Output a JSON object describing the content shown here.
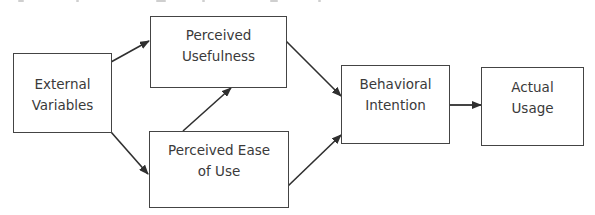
{
  "diagram": {
    "type": "flowchart",
    "colors": {
      "box_border": "#444444",
      "text": "#3a3a3a",
      "arrow": "#2f2f2f",
      "background": "#ffffff"
    },
    "nodes": [
      {
        "id": "external_variables",
        "lines": [
          "External",
          "Variables"
        ]
      },
      {
        "id": "perceived_usefulness",
        "lines": [
          "Perceived",
          "Usefulness"
        ]
      },
      {
        "id": "perceived_ease_of_use",
        "lines": [
          "Perceived Ease",
          "of Use"
        ]
      },
      {
        "id": "behavioral_intention",
        "lines": [
          "Behavioral",
          "Intention"
        ]
      },
      {
        "id": "actual_usage",
        "lines": [
          "Actual",
          "Usage"
        ]
      }
    ],
    "edges": [
      {
        "from": "external_variables",
        "to": "perceived_usefulness"
      },
      {
        "from": "external_variables",
        "to": "perceived_ease_of_use"
      },
      {
        "from": "perceived_ease_of_use",
        "to": "perceived_usefulness"
      },
      {
        "from": "perceived_usefulness",
        "to": "behavioral_intention"
      },
      {
        "from": "perceived_ease_of_use",
        "to": "behavioral_intention"
      },
      {
        "from": "behavioral_intention",
        "to": "actual_usage"
      }
    ]
  }
}
